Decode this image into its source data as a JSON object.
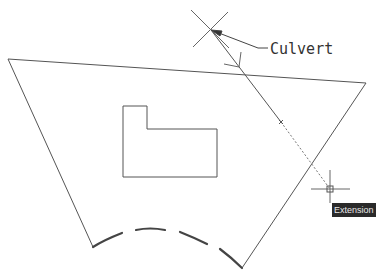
{
  "drawing": {
    "annotation_label": "Culvert",
    "tooltip_label": "Extension",
    "colors": {
      "background": "#ffffff",
      "geometry": "#555555",
      "tooltip_bg": "#2a2a2a",
      "tooltip_text": "#e8e8e8"
    },
    "icons": {
      "cursor": "crosshair-icon",
      "point_marker": "x-marker-icon",
      "leader_arrow": "arrow-icon"
    }
  }
}
